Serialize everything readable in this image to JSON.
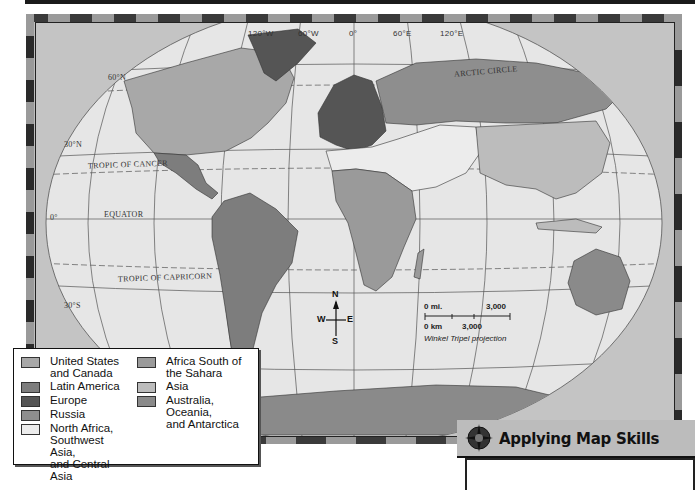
{
  "map": {
    "projection_label": "Winkel Tripel projection",
    "longitude_labels": [
      "120°W",
      "60°W",
      "0°",
      "60°E",
      "120°E"
    ],
    "latitude_labels": [
      "60°N",
      "30°N",
      "0°",
      "30°S"
    ],
    "line_labels": {
      "arctic_circle": "ARCTIC CIRCLE",
      "tropic_cancer": "TROPIC OF CANCER",
      "equator": "EQUATOR",
      "tropic_capricorn": "TROPIC OF CAPRICORN"
    },
    "compass": {
      "n": "N",
      "s": "S",
      "e": "E",
      "w": "W"
    },
    "scale": {
      "mi_start": "0 mi.",
      "mi_end": "3,000",
      "km_start": "0 km",
      "km_end": "3,000"
    },
    "colors": {
      "ocean": "#e6e6e6",
      "frame": "#c4c4c4",
      "us_canada": "#a8a8a8",
      "latin_america": "#7d7d7d",
      "europe": "#555555",
      "russia": "#8e8e8e",
      "nafrica_swasia": "#ececec",
      "africa_south": "#9a9a9a",
      "asia": "#bcbcbc",
      "australia_oceania": "#8a8a8a"
    }
  },
  "legend": {
    "left": [
      {
        "label": "United States\nand Canada",
        "line1": "United States",
        "line2": "and Canada",
        "color": "#a8a8a8"
      },
      {
        "label": "Latin America",
        "color": "#7d7d7d"
      },
      {
        "label": "Europe",
        "color": "#555555"
      },
      {
        "label": "Russia",
        "color": "#8e8e8e"
      },
      {
        "line1": "North Africa,",
        "line2": "Southwest Asia,",
        "line3": "and Central Asia",
        "color": "#ececec"
      }
    ],
    "right": [
      {
        "line1": "Africa South of",
        "line2": "the Sahara",
        "color": "#9a9a9a"
      },
      {
        "label": "Asia",
        "color": "#bcbcbc"
      },
      {
        "line1": "Australia, Oceania,",
        "line2": "and Antarctica",
        "color": "#8a8a8a"
      }
    ]
  },
  "applying_map_skills": {
    "title": "Applying Map Skills"
  }
}
